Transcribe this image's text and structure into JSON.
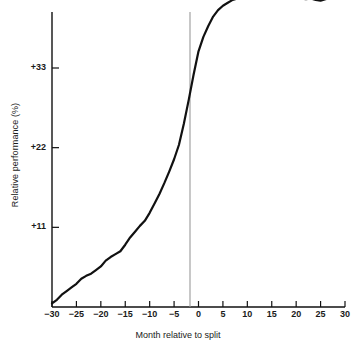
{
  "chart_data": {
    "type": "line",
    "title": "",
    "xlabel": "Month relative to split",
    "ylabel": "Relative performance (%)",
    "xlim": [
      -30,
      30
    ],
    "ylim": [
      0,
      47
    ],
    "grid": false,
    "legend": "none",
    "xticks": [
      -30,
      -25,
      -20,
      -15,
      -10,
      -5,
      0,
      5,
      10,
      15,
      20,
      25,
      30
    ],
    "xtick_labels": [
      "−30",
      "−25",
      "−20",
      "−15",
      "−10",
      "−5",
      "0",
      "5",
      "10",
      "15",
      "20",
      "25",
      "30"
    ],
    "yticks": [
      11,
      22,
      33
    ],
    "ytick_labels": [
      "+11",
      "+22",
      "+33"
    ],
    "annotations": [
      {
        "name": "split-event-line",
        "type": "vline",
        "x": 0,
        "color": "#9a9a9a"
      }
    ],
    "series": [
      {
        "name": "Cumulative average residual",
        "color": "#111111",
        "x": [
          -30,
          -29,
          -28,
          -27,
          -26,
          -25,
          -24,
          -23,
          -22,
          -21,
          -20,
          -19,
          -18,
          -17,
          -16,
          -15,
          -14,
          -13,
          -12,
          -11,
          -10,
          -9,
          -8,
          -7,
          -6,
          -5,
          -4,
          -3,
          -2,
          -1,
          0,
          1,
          2,
          3,
          4,
          5,
          6,
          7,
          8,
          9,
          10,
          11,
          12,
          13,
          14,
          15,
          16,
          17,
          18,
          19,
          20,
          21,
          22,
          23,
          24,
          25,
          26,
          27,
          28,
          29,
          30
        ],
        "values": [
          0.5,
          1.0,
          1.7,
          2.2,
          2.7,
          3.2,
          3.9,
          4.3,
          4.6,
          5.1,
          5.6,
          6.4,
          6.9,
          7.3,
          7.7,
          8.6,
          9.6,
          10.4,
          11.2,
          11.9,
          13.0,
          14.3,
          15.6,
          17.1,
          18.7,
          20.4,
          22.4,
          25.3,
          28.6,
          32.1,
          35.3,
          37.3,
          38.8,
          40.1,
          41.0,
          41.6,
          42.0,
          42.4,
          42.6,
          42.8,
          43.0,
          43.4,
          43.8,
          44.0,
          43.7,
          43.6,
          43.5,
          43.1,
          43.4,
          43.2,
          42.9,
          42.6,
          42.5,
          42.6,
          42.4,
          42.3,
          42.5,
          42.7,
          42.8,
          42.9,
          42.9
        ]
      }
    ]
  },
  "axis": {
    "y_axis_name": "y-axis-line",
    "x_axis_name": "x-axis-line"
  }
}
